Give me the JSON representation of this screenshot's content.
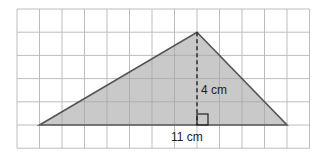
{
  "diagram": {
    "type": "triangle-on-grid",
    "grid": {
      "columns": 13,
      "rows": 6,
      "x_lines": [
        17,
        39.5,
        62,
        84.5,
        107,
        129.5,
        152,
        174.5,
        197,
        219.5,
        242,
        264.5,
        287,
        309.5
      ],
      "y_lines": [
        9,
        32.2,
        55.4,
        78.6,
        101.8,
        125,
        148.2
      ],
      "line_color": "#bdbdbd"
    },
    "triangle": {
      "points": [
        [
          39.5,
          125
        ],
        [
          197,
          32.2
        ],
        [
          287,
          125
        ]
      ],
      "fill": "#c9c9c9",
      "stroke": "#555555"
    },
    "height_line": {
      "x": 197,
      "y1": 32.2,
      "y2": 125,
      "stroke": "#222222"
    },
    "right_angle_marker": {
      "x": 197,
      "y": 114,
      "size": 11
    },
    "labels": {
      "height": "4 cm",
      "base": "11 cm"
    }
  }
}
